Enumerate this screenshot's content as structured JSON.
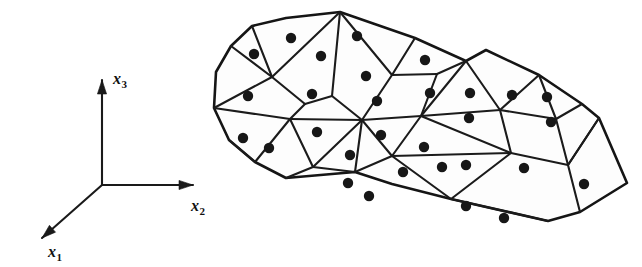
{
  "figure": {
    "background_color": "#ffffff",
    "line_color": "#1a1a1a",
    "node_dot_color": "#171717",
    "element_fill_color": "#fdfdfd",
    "width": 642,
    "height": 267
  },
  "axes": {
    "name": "cartesian-coordinate-triad",
    "origin": {
      "x": 102,
      "y": 185
    },
    "items": [
      {
        "id": "x3",
        "label_base": "x",
        "label_sub": "3",
        "label_text": "x3",
        "direction": "up",
        "tip": {
          "x": 102,
          "y": 80
        },
        "label_pos": {
          "x": 113,
          "y": 84
        }
      },
      {
        "id": "x2",
        "label_base": "x",
        "label_sub": "2",
        "label_text": "x2",
        "direction": "right",
        "tip": {
          "x": 193,
          "y": 185
        },
        "label_pos": {
          "x": 191,
          "y": 211
        }
      },
      {
        "id": "x1",
        "label_base": "x",
        "label_sub": "1",
        "label_text": "x1",
        "direction": "down-left",
        "tip": {
          "x": 42,
          "y": 238
        },
        "label_pos": {
          "x": 48,
          "y": 257
        }
      }
    ]
  },
  "mesh": {
    "name": "element-mesh",
    "element_count": 35,
    "node_count": 35,
    "outline_path": "M 231,46 L 252,26 L 286,18 L 340,12 L 415,38 L 466,61 L 486,50 L 539,75 L 582,104 L 599,118 L 627,183 L 580,212 L 548,221 L 451,199 L 392,184 L 355,172 L 286,178 L 255,162 L 229,140 L 214,108 L 216,72 Z",
    "edges": [
      "M 231,46 L 272,77",
      "M 272,77 L 252,26",
      "M 272,77 L 340,12",
      "M 272,77 L 305,104",
      "M 340,12 L 332,96",
      "M 332,96 L 305,104",
      "M 332,96 L 362,120",
      "M 340,12 L 392,75",
      "M 392,75 L 415,38",
      "M 392,75 L 362,120",
      "M 392,75 L 437,74",
      "M 437,74 L 466,61",
      "M 437,74 L 421,116",
      "M 421,116 L 362,120",
      "M 421,116 L 466,61",
      "M 466,61 L 500,110",
      "M 500,110 L 421,116",
      "M 500,110 L 539,75",
      "M 500,110 L 511,153",
      "M 539,75 L 556,119",
      "M 556,119 L 500,110",
      "M 556,119 L 582,104",
      "M 556,119 L 568,165",
      "M 568,165 L 511,153",
      "M 568,165 L 599,118",
      "M 568,165 L 580,212",
      "M 599,118 L 568,165",
      "M 214,108 L 272,77",
      "M 214,108 L 290,119",
      "M 290,119 L 305,104",
      "M 290,119 L 362,120",
      "M 290,119 L 255,162",
      "M 290,119 L 313,167",
      "M 255,162 L 229,140",
      "M 313,167 L 286,178",
      "M 313,167 L 362,120",
      "M 313,167 L 355,172",
      "M 355,172 L 362,120",
      "M 362,120 L 392,156",
      "M 392,156 L 355,172",
      "M 392,156 L 421,116",
      "M 392,156 L 451,199",
      "M 392,156 L 511,153",
      "M 511,153 L 451,199",
      "M 511,153 L 421,116",
      "M 451,199 L 548,221"
    ],
    "nodes": [
      {
        "x": 254,
        "y": 54
      },
      {
        "x": 291,
        "y": 38
      },
      {
        "x": 321,
        "y": 56
      },
      {
        "x": 357,
        "y": 36
      },
      {
        "x": 366,
        "y": 76
      },
      {
        "x": 425,
        "y": 60
      },
      {
        "x": 248,
        "y": 96
      },
      {
        "x": 312,
        "y": 94
      },
      {
        "x": 377,
        "y": 101
      },
      {
        "x": 430,
        "y": 93
      },
      {
        "x": 470,
        "y": 93
      },
      {
        "x": 512,
        "y": 95
      },
      {
        "x": 547,
        "y": 97
      },
      {
        "x": 243,
        "y": 138
      },
      {
        "x": 269,
        "y": 148
      },
      {
        "x": 317,
        "y": 132
      },
      {
        "x": 381,
        "y": 135
      },
      {
        "x": 350,
        "y": 155
      },
      {
        "x": 424,
        "y": 147
      },
      {
        "x": 469,
        "y": 118
      },
      {
        "x": 551,
        "y": 122
      },
      {
        "x": 348,
        "y": 183
      },
      {
        "x": 369,
        "y": 196
      },
      {
        "x": 403,
        "y": 172
      },
      {
        "x": 442,
        "y": 167
      },
      {
        "x": 466,
        "y": 165
      },
      {
        "x": 524,
        "y": 168
      },
      {
        "x": 584,
        "y": 184
      },
      {
        "x": 466,
        "y": 206
      },
      {
        "x": 504,
        "y": 218
      }
    ]
  }
}
